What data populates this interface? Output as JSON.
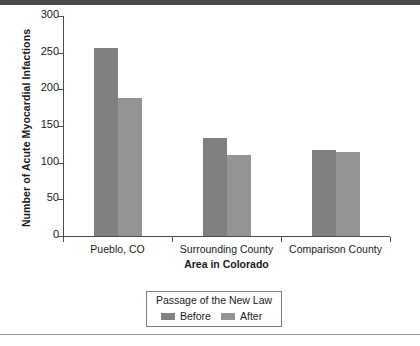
{
  "chart_data": {
    "type": "bar",
    "title": "",
    "xlabel": "Area in Colorado",
    "ylabel": "Number of Acute Myocardial Infactions",
    "categories": [
      "Pueblo, CO",
      "Surrounding County",
      "Comparison County"
    ],
    "series": [
      {
        "name": "Before",
        "color": "#808080",
        "values": [
          256,
          133,
          117
        ]
      },
      {
        "name": "After",
        "color": "#949494",
        "values": [
          188,
          111,
          114
        ]
      }
    ],
    "ylim": [
      0,
      300
    ],
    "yticks": [
      0,
      50,
      100,
      150,
      200,
      250,
      300
    ],
    "ytick_labels": [
      "0",
      "50",
      "100",
      "150",
      "200",
      "250",
      "300"
    ],
    "grid": false,
    "legend": {
      "title": "Passage of the New Law",
      "position": "below-center",
      "entries": [
        "Before",
        "After"
      ]
    }
  },
  "axes": {
    "y_title": "Number of Acute Myocardial Infactions",
    "x_title": "Area in Colorado"
  },
  "legend": {
    "title": "Passage of the New Law",
    "before_label": "Before",
    "after_label": "After"
  },
  "colors": {
    "before": "#808080",
    "after": "#949494",
    "axis": "#4d4d4d",
    "top_rule": "#4a4a4a",
    "bottom_rule": "#9a9a9a"
  }
}
